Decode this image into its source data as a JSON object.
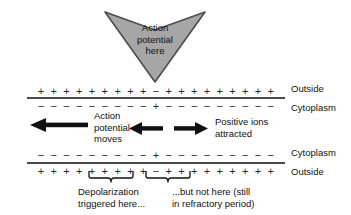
{
  "diagram": {
    "title_text": "Action potential propagation along an axon membrane",
    "colors": {
      "chevron_fill": "#a6a6a6",
      "chevron_stroke": "#4d4d4d",
      "membrane_line": "#4a4a4a",
      "text": "#111111",
      "charge_text": "#2a2a2a"
    }
  },
  "chevron": {
    "name": "action-potential-chevron",
    "line1": "Action",
    "line2": "potential",
    "line3": "here"
  },
  "membrane_top": {
    "outside_label": "Outside",
    "cytoplasm_label": "Cytoplasm",
    "outside_charges": [
      "+",
      "+",
      "+",
      "+",
      "+",
      "+",
      "+",
      "+",
      "+",
      "−",
      "+",
      "+",
      "+",
      "+",
      "+",
      "+",
      "+",
      "+",
      "+"
    ],
    "cytoplasm_charges": [
      "−",
      "−",
      "−",
      "−",
      "−",
      "−",
      "−",
      "−",
      "−",
      "+",
      "−",
      "−",
      "−",
      "−",
      "−",
      "−",
      "−",
      "−",
      "−"
    ]
  },
  "membrane_bottom": {
    "cytoplasm_label": "Cytoplasm",
    "outside_label": "Outside",
    "cytoplasm_charges": [
      "−",
      "−",
      "−",
      "−",
      "−",
      "−",
      "−",
      "−",
      "−",
      "+",
      "−",
      "−",
      "−",
      "−",
      "−",
      "−",
      "−",
      "−",
      "−"
    ],
    "outside_charges": [
      "+",
      "+",
      "+",
      "+",
      "+",
      "+",
      "+",
      "+",
      "+",
      "−",
      "+",
      "+",
      "+",
      "+",
      "+",
      "+",
      "+",
      "+",
      "+"
    ]
  },
  "annotations": {
    "action_potential_moves": {
      "line1": "Action",
      "line2": "potential",
      "line3": "moves",
      "arrow_direction": "left"
    },
    "positive_ions": {
      "line1": "Positive ions",
      "line2": "attracted",
      "arrow_left_direction": "left",
      "arrow_right_direction": "right"
    },
    "depolarization": {
      "line1": "Depolarization",
      "line2": "triggered here..."
    },
    "refractory": {
      "line1": "...but not here (still",
      "line2": "in refractory period)"
    }
  }
}
